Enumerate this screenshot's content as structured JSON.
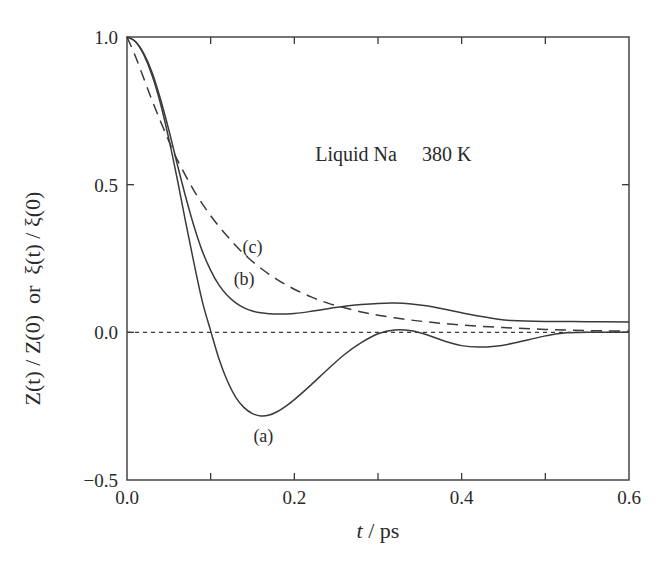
{
  "chart_data": {
    "type": "line",
    "title": "",
    "xlabel_italic": "t",
    "xlabel_rest": " / ps",
    "ylabel": "Z(t) / Z(0)  or  ξ(t) / ξ(0)",
    "xlim": [
      0.0,
      0.6
    ],
    "ylim": [
      -0.5,
      1.0
    ],
    "x_ticks": [
      0.0,
      0.1,
      0.2,
      0.3,
      0.4,
      0.5,
      0.6
    ],
    "x_tick_labels": [
      {
        "value": 0.0,
        "label": "0.0"
      },
      {
        "value": 0.2,
        "label": "0.2"
      },
      {
        "value": 0.4,
        "label": "0.4"
      },
      {
        "value": 0.6,
        "label": "0.6"
      }
    ],
    "y_ticks": [
      -0.5,
      0.0,
      0.5,
      1.0
    ],
    "y_tick_labels": [
      {
        "value": 1.0,
        "label": "1.0"
      },
      {
        "value": 0.5,
        "label": "0.5"
      },
      {
        "value": 0.0,
        "label": "0.0"
      },
      {
        "value": -0.5,
        "label": "−0.5"
      }
    ],
    "grid": false,
    "annotation": {
      "text": "Liquid Na     380 K",
      "x": 0.225,
      "y": 0.58
    },
    "zero_line": {
      "y": 0.0,
      "style": "dotted"
    },
    "series": [
      {
        "name": "(a)",
        "style": "solid",
        "label_pos": {
          "x": 0.163,
          "y": -0.37
        },
        "x": [
          0.0,
          0.01,
          0.02,
          0.03,
          0.04,
          0.05,
          0.06,
          0.07,
          0.08,
          0.09,
          0.1,
          0.11,
          0.12,
          0.13,
          0.14,
          0.15,
          0.16,
          0.17,
          0.18,
          0.19,
          0.2,
          0.22,
          0.24,
          0.26,
          0.28,
          0.3,
          0.32,
          0.34,
          0.36,
          0.38,
          0.4,
          0.42,
          0.44,
          0.46,
          0.48,
          0.5,
          0.52,
          0.55,
          0.6
        ],
        "y": [
          1.0,
          0.985,
          0.94,
          0.87,
          0.775,
          0.655,
          0.52,
          0.375,
          0.235,
          0.105,
          0.005,
          -0.09,
          -0.165,
          -0.22,
          -0.255,
          -0.275,
          -0.283,
          -0.28,
          -0.268,
          -0.25,
          -0.228,
          -0.178,
          -0.125,
          -0.075,
          -0.035,
          -0.005,
          0.008,
          0.005,
          -0.01,
          -0.03,
          -0.045,
          -0.05,
          -0.047,
          -0.038,
          -0.025,
          -0.012,
          -0.003,
          0.0,
          0.0
        ]
      },
      {
        "name": "(b)",
        "style": "solid",
        "label_pos": {
          "x": 0.14,
          "y": 0.16
        },
        "x": [
          0.0,
          0.01,
          0.02,
          0.03,
          0.04,
          0.05,
          0.06,
          0.07,
          0.08,
          0.09,
          0.1,
          0.11,
          0.12,
          0.13,
          0.14,
          0.15,
          0.16,
          0.17,
          0.18,
          0.2,
          0.22,
          0.24,
          0.26,
          0.28,
          0.3,
          0.32,
          0.34,
          0.36,
          0.38,
          0.4,
          0.42,
          0.44,
          0.46,
          0.5,
          0.55,
          0.6
        ],
        "y": [
          1.0,
          0.985,
          0.945,
          0.88,
          0.79,
          0.685,
          0.57,
          0.46,
          0.36,
          0.275,
          0.21,
          0.16,
          0.125,
          0.1,
          0.083,
          0.072,
          0.066,
          0.063,
          0.062,
          0.064,
          0.071,
          0.08,
          0.088,
          0.094,
          0.098,
          0.099,
          0.096,
          0.089,
          0.078,
          0.066,
          0.055,
          0.046,
          0.04,
          0.037,
          0.036,
          0.035
        ]
      },
      {
        "name": "(c)",
        "style": "dashed",
        "label_pos": {
          "x": 0.15,
          "y": 0.27
        },
        "x": [
          0.0,
          0.01,
          0.02,
          0.03,
          0.04,
          0.05,
          0.06,
          0.08,
          0.1,
          0.12,
          0.14,
          0.16,
          0.18,
          0.2,
          0.22,
          0.24,
          0.26,
          0.28,
          0.3,
          0.33,
          0.36,
          0.4,
          0.45,
          0.5,
          0.55,
          0.6
        ],
        "y": [
          1.0,
          0.935,
          0.86,
          0.785,
          0.715,
          0.648,
          0.585,
          0.48,
          0.395,
          0.325,
          0.265,
          0.217,
          0.178,
          0.146,
          0.12,
          0.099,
          0.083,
          0.069,
          0.058,
          0.045,
          0.035,
          0.025,
          0.016,
          0.01,
          0.006,
          0.004
        ]
      }
    ]
  }
}
